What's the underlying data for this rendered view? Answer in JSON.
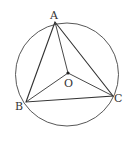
{
  "diagram": {
    "circle": {
      "cx": 67,
      "cy": 74.5,
      "r": 51.5
    },
    "points": {
      "A": {
        "x": 55,
        "y": 22,
        "label": "A",
        "lx": 50,
        "ly": 19
      },
      "B": {
        "x": 26,
        "y": 102,
        "label": "B",
        "lx": 15,
        "ly": 110
      },
      "C": {
        "x": 113,
        "y": 96,
        "label": "C",
        "lx": 114,
        "ly": 102
      },
      "O": {
        "x": 68,
        "y": 73,
        "label": "O",
        "lx": 64,
        "ly": 87
      }
    },
    "segments": [
      "AB",
      "BC",
      "CA",
      "OA",
      "OB",
      "OC"
    ],
    "stroke": "#333333"
  }
}
